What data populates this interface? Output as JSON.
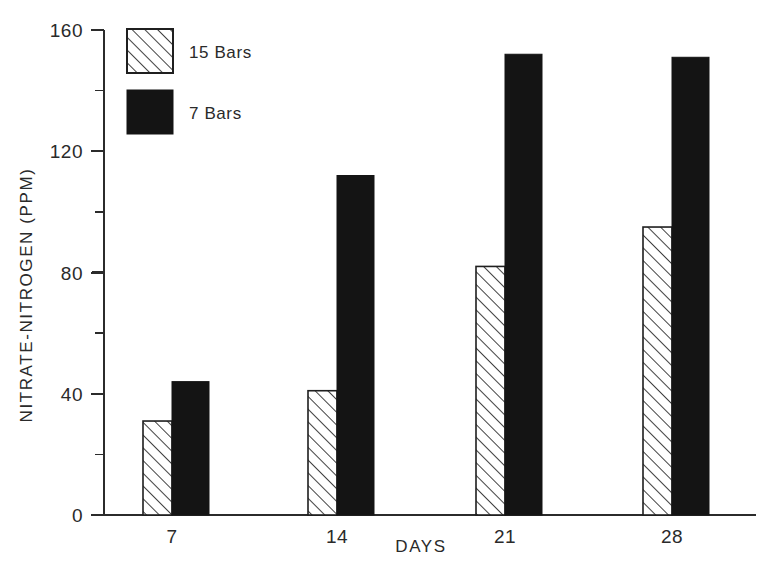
{
  "chart_data": {
    "type": "bar",
    "title": "",
    "subtitle": "",
    "xlabel": "DAYS",
    "ylabel": "NITRATE-NITROGEN (PPM)",
    "categories": [
      "7",
      "14",
      "21",
      "28"
    ],
    "series": [
      {
        "name": "15 Bars",
        "pattern": "hatched",
        "values": [
          31,
          41,
          82,
          95
        ]
      },
      {
        "name": "7 Bars",
        "pattern": "solid",
        "values": [
          44,
          112,
          152,
          151
        ]
      }
    ],
    "ylim": [
      0,
      160
    ],
    "ytick_labels": [
      "0",
      "40",
      "80",
      "120",
      "160"
    ],
    "ytick_values": [
      0,
      40,
      80,
      120,
      160
    ],
    "yminor_tick_values": [
      20,
      60,
      100,
      140
    ],
    "grid": false,
    "legend_position": "top-left-inside"
  },
  "legend": {
    "entries": [
      {
        "label": "15 Bars",
        "swatch": "hatched-square"
      },
      {
        "label": "7 Bars",
        "swatch": "solid-black-square"
      }
    ]
  },
  "colors": {
    "series_solid": "#141414",
    "series_hatch_line": "#1f1f1f",
    "axis": "#2b2b2b",
    "text": "#2a2a2a",
    "background": "#ffffff"
  }
}
